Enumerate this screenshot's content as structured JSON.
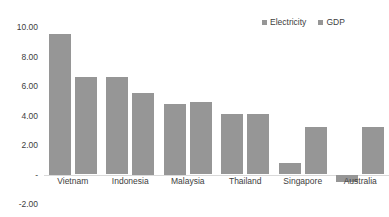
{
  "chart_data": {
    "type": "bar",
    "title": "",
    "subtitle": "",
    "xlabel": "",
    "ylabel": "",
    "categories": [
      "Vietnam",
      "Indonesia",
      "Malaysia",
      "Thailand",
      "Singapore",
      "Australia"
    ],
    "series": [
      {
        "name": "Electricity",
        "color": "#969696",
        "values": [
          9.5,
          6.6,
          4.75,
          4.1,
          0.8,
          -0.5
        ]
      },
      {
        "name": "GDP",
        "color": "#969696",
        "values": [
          6.6,
          5.5,
          4.9,
          4.1,
          3.2,
          3.2
        ]
      }
    ],
    "ylim": [
      -2.0,
      10.0
    ],
    "ytick_values": [
      10.0,
      8.0,
      6.0,
      4.0,
      2.0,
      0.0,
      -2.0
    ],
    "ytick_labels": [
      "10.00",
      "8.00",
      "6.00",
      "4.00",
      "2.00",
      "-",
      "-2.00"
    ],
    "grid": false,
    "legend_position": "top-right"
  },
  "legend": {
    "entries": [
      {
        "label": "Electricity",
        "color": "#969696"
      },
      {
        "label": "GDP",
        "color": "#969696"
      }
    ]
  }
}
